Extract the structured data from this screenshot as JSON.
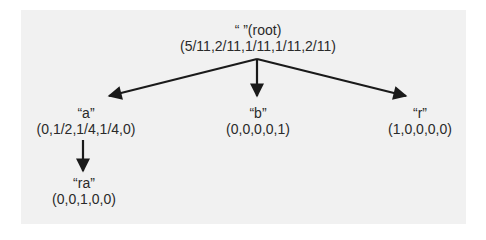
{
  "diagram": {
    "type": "tree",
    "colors": {
      "background": "#f1f1f1",
      "edge": "#1a1a1a",
      "text": "#2a2a2a"
    },
    "nodes": {
      "root": {
        "label": "“ ”(root)",
        "dist": "(5/11,2/11,1/11,1/11,2/11)"
      },
      "a": {
        "label": "“a”",
        "dist": "(0,1/2,1/4,1/4,0)"
      },
      "b": {
        "label": "“b”",
        "dist": "(0,0,0,0,1)"
      },
      "r": {
        "label": "“r”",
        "dist": "(1,0,0,0,0)"
      },
      "ra": {
        "label": "“ra”",
        "dist": "(0,0,1,0,0)"
      }
    },
    "edges": [
      {
        "from": "root",
        "to": "a"
      },
      {
        "from": "root",
        "to": "b"
      },
      {
        "from": "root",
        "to": "r"
      },
      {
        "from": "a",
        "to": "ra"
      }
    ]
  }
}
